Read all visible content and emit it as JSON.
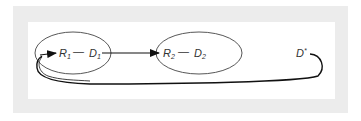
{
  "diagram": {
    "nodes": [
      {
        "id": "R1",
        "label": "R",
        "subscript": "1"
      },
      {
        "id": "D1",
        "label": "D",
        "subscript": "1"
      },
      {
        "id": "R2",
        "label": "R",
        "subscript": "2"
      },
      {
        "id": "D2",
        "label": "D",
        "subscript": "2"
      },
      {
        "id": "Dstar",
        "label": "D",
        "superscript": "*"
      }
    ],
    "groups": [
      {
        "id": "group1",
        "members": [
          "R1",
          "D1"
        ]
      },
      {
        "id": "group2",
        "members": [
          "R2",
          "D2"
        ]
      }
    ],
    "links": [
      {
        "from": "R1",
        "to": "D1",
        "style": "line",
        "connector": "—"
      },
      {
        "from": "R2",
        "to": "D2",
        "style": "line",
        "connector": "—"
      },
      {
        "from": "D1",
        "to": "R2",
        "style": "arrow"
      },
      {
        "from": "Dstar",
        "to": "R1",
        "style": "curved-arrow"
      }
    ],
    "colors": {
      "frame": "#ececec",
      "stroke": "#222222",
      "text": "#333333"
    }
  }
}
